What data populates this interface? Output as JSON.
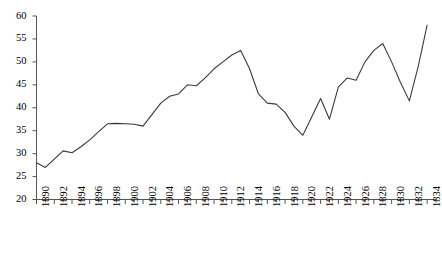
{
  "chart_data": {
    "type": "line",
    "title": "",
    "subtitle": "",
    "xlabel": "",
    "ylabel": "",
    "xlim": [
      1890,
      1935
    ],
    "ylim": [
      20,
      60
    ],
    "yticks": [
      20,
      25,
      30,
      35,
      40,
      45,
      50,
      55,
      60
    ],
    "xtick_step": 2,
    "xtick_labels": [
      "1890",
      "1892",
      "1894",
      "1896",
      "1898",
      "1900",
      "1902",
      "1904",
      "1906",
      "1908",
      "1910",
      "1912",
      "1914",
      "1916",
      "1918",
      "1920",
      "1922",
      "1924",
      "1926",
      "1828",
      "1830",
      "1832",
      "1834"
    ],
    "xtick_label_note": "Last four tick labels read 1828/1830/1832/1834 in the source image (original typo for 1928/1930/1932/1934).",
    "minor_ticks": true,
    "grid": false,
    "legend": null,
    "legend_position": "none",
    "line_color": "#3a3a3a",
    "line_width": 1.1,
    "markers": false,
    "x": [
      1890,
      1891,
      1892,
      1893,
      1894,
      1895,
      1896,
      1897,
      1898,
      1899,
      1900,
      1901,
      1902,
      1903,
      1904,
      1905,
      1906,
      1907,
      1908,
      1909,
      1910,
      1911,
      1912,
      1913,
      1914,
      1915,
      1916,
      1917,
      1918,
      1919,
      1920,
      1921,
      1922,
      1923,
      1924,
      1925,
      1926,
      1927,
      1928,
      1929,
      1930,
      1931,
      1932,
      1933,
      1934
    ],
    "values": [
      28.0,
      27.0,
      28.8,
      30.6,
      30.2,
      31.5,
      33.0,
      34.8,
      36.5,
      36.6,
      36.5,
      36.4,
      36.0,
      38.5,
      41.0,
      42.5,
      43.0,
      45.0,
      44.8,
      46.5,
      48.5,
      50.0,
      51.5,
      52.5,
      48.5,
      43.0,
      41.0,
      40.8,
      39.0,
      36.0,
      34.0,
      38.0,
      42.0,
      37.5,
      44.5,
      46.5,
      46.0,
      50.0,
      52.5,
      54.0,
      50.0,
      45.5,
      41.5,
      49.0,
      58.0
    ],
    "series": [
      {
        "name": "series-1",
        "values": [
          28.0,
          27.0,
          28.8,
          30.6,
          30.2,
          31.5,
          33.0,
          34.8,
          36.5,
          36.6,
          36.5,
          36.4,
          36.0,
          38.5,
          41.0,
          42.5,
          43.0,
          45.0,
          44.8,
          46.5,
          48.5,
          50.0,
          51.5,
          52.5,
          48.5,
          43.0,
          41.0,
          40.8,
          39.0,
          36.0,
          34.0,
          38.0,
          42.0,
          37.5,
          44.5,
          46.5,
          46.0,
          50.0,
          52.5,
          54.0,
          50.0,
          45.5,
          41.5,
          49.0,
          58.0
        ]
      }
    ],
    "annotations": []
  }
}
